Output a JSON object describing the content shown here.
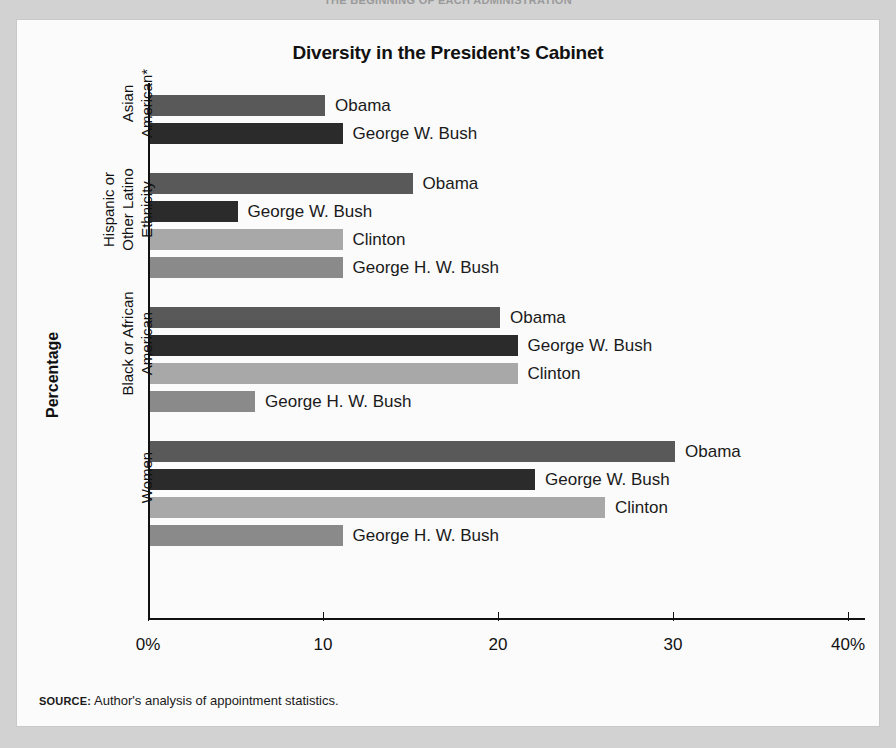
{
  "page": {
    "running_head": "THE BEGINNING OF EACH ADMINISTRATION",
    "bleed_text": ""
  },
  "source_note": {
    "label": "SOURCE:",
    "text": " Author's analysis of appointment statistics."
  },
  "chart_data": {
    "type": "bar",
    "orientation": "horizontal",
    "title": "Diversity in the President’s Cabinet",
    "xlabel": "",
    "ylabel": "Percentage",
    "xlim": [
      0,
      40
    ],
    "grid": false,
    "legend": "inline-labels",
    "xticks": [
      0,
      10,
      20,
      30,
      40
    ],
    "xtick_labels": [
      "0%",
      "10",
      "20",
      "30",
      "40%"
    ],
    "categories": [
      "Asian\nAmerican*",
      "Hispanic or\nOther Latino\nEthnicity",
      "Black or African\nAmerican",
      "Women"
    ],
    "category_labels": [
      {
        "line1": "Asian",
        "line2": "American*"
      },
      {
        "line1": "Hispanic or",
        "line2": "Other Latino",
        "line3": "Ethnicity"
      },
      {
        "line1": "Black or African",
        "line2": "American"
      },
      {
        "line1": "Women"
      }
    ],
    "series_colors": {
      "Obama": "#595959",
      "George W. Bush": "#2b2b2b",
      "Clinton": "#a8a8a8",
      "George H. W. Bush": "#8a8a8a"
    },
    "groups": [
      {
        "category": "Asian American*",
        "bars": [
          {
            "name": "Obama",
            "value": 10,
            "color": "#595959"
          },
          {
            "name": "George W. Bush",
            "value": 11,
            "color": "#2b2b2b"
          }
        ]
      },
      {
        "category": "Hispanic or Other Latino Ethnicity",
        "bars": [
          {
            "name": "Obama",
            "value": 15,
            "color": "#595959"
          },
          {
            "name": "George W. Bush",
            "value": 5,
            "color": "#2b2b2b"
          },
          {
            "name": "Clinton",
            "value": 11,
            "color": "#a8a8a8"
          },
          {
            "name": "George H. W. Bush",
            "value": 11,
            "color": "#8a8a8a"
          }
        ]
      },
      {
        "category": "Black or African American",
        "bars": [
          {
            "name": "Obama",
            "value": 20,
            "color": "#595959"
          },
          {
            "name": "George W. Bush",
            "value": 21,
            "color": "#2b2b2b"
          },
          {
            "name": "Clinton",
            "value": 21,
            "color": "#a8a8a8"
          },
          {
            "name": "George H. W. Bush",
            "value": 6,
            "color": "#8a8a8a"
          }
        ]
      },
      {
        "category": "Women",
        "bars": [
          {
            "name": "Obama",
            "value": 30,
            "color": "#595959"
          },
          {
            "name": "George W. Bush",
            "value": 22,
            "color": "#2b2b2b"
          },
          {
            "name": "Clinton",
            "value": 26,
            "color": "#a8a8a8"
          },
          {
            "name": "George H. W. Bush",
            "value": 11,
            "color": "#8a8a8a"
          }
        ]
      }
    ]
  }
}
